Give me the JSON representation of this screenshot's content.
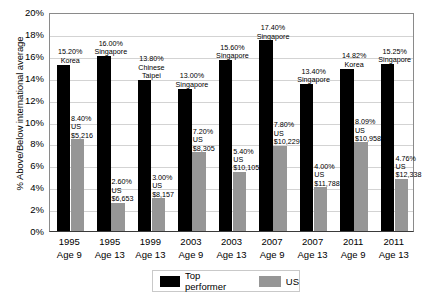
{
  "chart_data": {
    "type": "bar",
    "title": "",
    "xlabel": "",
    "ylabel": "% Above/Below international average",
    "ylim": [
      0,
      20
    ],
    "ytick_labels": [
      "20%",
      "18%",
      "16%",
      "14%",
      "12%",
      "10%",
      "8%",
      "6%",
      "4%",
      "2%",
      "0%"
    ],
    "ytick_values": [
      20,
      18,
      16,
      14,
      12,
      10,
      8,
      6,
      4,
      2,
      0
    ],
    "grid": true,
    "legend_position": "bottom",
    "categories": [
      "1995 Age 9",
      "1995 Age 13",
      "1999 Age 13",
      "2003 Age 9",
      "2003 Age 13",
      "2007 Age 9",
      "2007 Age 13",
      "2011 Age 9",
      "2011 Age 13"
    ],
    "category_years": [
      "1995",
      "1995",
      "1999",
      "2003",
      "2003",
      "2007",
      "2007",
      "2011",
      "2011"
    ],
    "category_ages": [
      "Age 9",
      "Age 13",
      "Age 13",
      "Age 9",
      "Age 13",
      "Age 9",
      "Age 13",
      "Age 9",
      "Age 13"
    ],
    "series": [
      {
        "name": "Top performer",
        "color": "#000000",
        "values": [
          15.2,
          16.0,
          13.8,
          13.0,
          15.6,
          17.4,
          13.4,
          14.82,
          15.25
        ],
        "value_labels": [
          "15.20%",
          "16.00%",
          "13.80%",
          "13.00%",
          "15.60%",
          "17.40%",
          "13.40%",
          "14.82%",
          "15.25%"
        ],
        "country_labels": [
          "Korea",
          "Singapore",
          "Chinese Taipei",
          "Singapore",
          "Singapore",
          "Singapore",
          "Singapore",
          "Korea",
          "Singapore"
        ]
      },
      {
        "name": "US",
        "color": "#969696",
        "values": [
          8.4,
          2.6,
          3.0,
          7.2,
          5.4,
          7.8,
          4.0,
          8.09,
          4.76
        ],
        "value_labels": [
          "8.40%",
          "2.60%",
          "3.00%",
          "7.20%",
          "5.40%",
          "7.80%",
          "4.00%",
          "8.09%",
          "4.76%"
        ],
        "country_labels": [
          "US",
          "US",
          "US",
          "US",
          "US",
          "US",
          "US",
          "US",
          "US"
        ],
        "amount_labels": [
          "$5,216",
          "$6,653",
          "$8,157",
          "$8,305",
          "$10,105",
          "$10,229",
          "$11,788",
          "$10,958",
          "$12,338"
        ]
      }
    ],
    "legend_entries": [
      {
        "label": "Top performer",
        "color": "#000000"
      },
      {
        "label": "US",
        "color": "#969696"
      }
    ]
  }
}
